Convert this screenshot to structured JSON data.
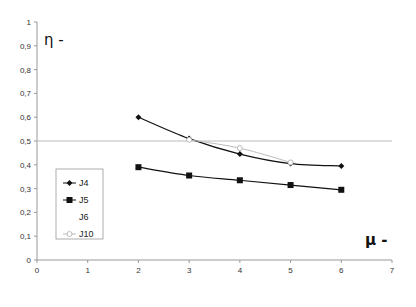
{
  "chart_data": {
    "type": "line",
    "title": "",
    "xlabel": "μ -",
    "ylabel": "η -",
    "xlim": [
      0,
      7
    ],
    "ylim": [
      0,
      1
    ],
    "x_ticks": [
      "0",
      "1",
      "2",
      "3",
      "4",
      "5",
      "6",
      "7"
    ],
    "y_ticks": [
      "0",
      "0,1",
      "0,2",
      "0,3",
      "0,4",
      "0,5",
      "0,6",
      "0,7",
      "0,8",
      "0,9",
      "1"
    ],
    "grid": false,
    "reference_line": {
      "y": 0.5,
      "color": "#bbbbbb"
    },
    "legend_position": "inside-left",
    "series": [
      {
        "name": "J4",
        "marker": "diamond",
        "color": "#111111",
        "x": [
          2,
          3,
          4,
          5,
          6
        ],
        "values": [
          0.6,
          0.51,
          0.445,
          0.405,
          0.395
        ]
      },
      {
        "name": "J5",
        "marker": "square",
        "color": "#111111",
        "x": [
          2,
          3,
          4,
          5,
          6
        ],
        "values": [
          0.39,
          0.355,
          0.335,
          0.315,
          0.295
        ]
      },
      {
        "name": "J6",
        "marker": "none",
        "color": "#ffffff",
        "x": [],
        "values": []
      },
      {
        "name": "J10",
        "marker": "circle-open",
        "color": "#bbbbbb",
        "x": [
          3,
          4,
          5
        ],
        "values": [
          0.505,
          0.47,
          0.41
        ]
      }
    ]
  },
  "legend": {
    "items": [
      {
        "label": "J4"
      },
      {
        "label": "J5"
      },
      {
        "label": "J6"
      },
      {
        "label": "J10"
      }
    ]
  },
  "axes": {
    "x_title": "μ -",
    "y_title": "η -"
  }
}
